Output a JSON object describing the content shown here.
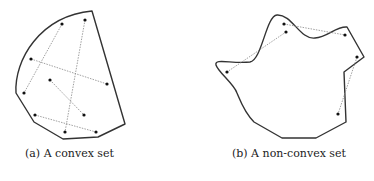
{
  "figures": [
    {
      "id": "a",
      "caption": "(a) A convex set",
      "outline_path": "M92,11 L125,124 L98,137 L63,139 L34,122 L16,93 C14,60 40,16 92,11 Z",
      "points": [
        [
          62,
          24
        ],
        [
          85,
          20
        ],
        [
          31,
          59
        ],
        [
          107,
          84
        ],
        [
          50,
          80
        ],
        [
          24,
          93
        ],
        [
          84,
          115
        ],
        [
          35,
          115
        ],
        [
          65,
          132
        ],
        [
          96,
          132
        ]
      ],
      "segments": [
        [
          [
            62,
            24
          ],
          [
            24,
            93
          ]
        ],
        [
          [
            85,
            20
          ],
          [
            65,
            132
          ]
        ],
        [
          [
            31,
            59
          ],
          [
            107,
            84
          ]
        ],
        [
          [
            50,
            80
          ],
          [
            84,
            115
          ]
        ],
        [
          [
            35,
            115
          ],
          [
            96,
            132
          ]
        ]
      ]
    },
    {
      "id": "b",
      "caption": "(b) A non-convex set",
      "outline_path": "M216,65 C214,58 232,64 250,62 C262,60 266,16 277,15 C292,14 300,40 315,38 C328,37 336,26 347,27 L364,57 L344,72 L346,122 L316,138 L282,138 L254,122 C244,112 240,100 237,93 C234,84 218,72 216,65 Z",
      "points": [
        [
          284,
          24
        ],
        [
          286,
          32
        ],
        [
          345,
          35
        ],
        [
          357,
          57
        ],
        [
          227,
          72
        ],
        [
          338,
          114
        ]
      ],
      "segments": [
        [
          [
            284,
            24
          ],
          [
            345,
            35
          ]
        ],
        [
          [
            286,
            32
          ],
          [
            227,
            72
          ]
        ],
        [
          [
            357,
            57
          ],
          [
            338,
            114
          ]
        ]
      ]
    }
  ],
  "colors": {
    "outline": "#333333",
    "dashed": "#888888",
    "point": "#111111"
  }
}
